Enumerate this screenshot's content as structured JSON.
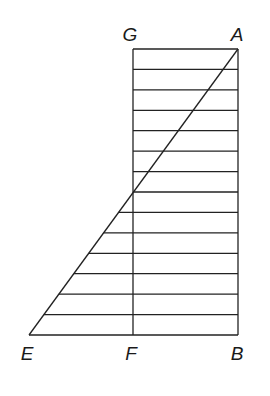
{
  "figure": {
    "type": "geometric-diagram",
    "stroke_color": "#222222",
    "background": "#ffffff",
    "points": {
      "G": {
        "label": "G",
        "x": 133,
        "y": 49
      },
      "A": {
        "label": "A",
        "x": 238,
        "y": 49
      },
      "E": {
        "label": "E",
        "x": 29,
        "y": 335
      },
      "F": {
        "label": "F",
        "x": 133,
        "y": 335
      },
      "B": {
        "label": "B",
        "x": 238,
        "y": 335
      }
    },
    "label_positions": {
      "G": {
        "x": 130,
        "y": 34
      },
      "A": {
        "x": 237,
        "y": 34
      },
      "E": {
        "x": 27,
        "y": 353
      },
      "F": {
        "x": 131,
        "y": 353
      },
      "B": {
        "x": 237,
        "y": 353
      }
    },
    "rectangle": {
      "corners": [
        "G",
        "A",
        "B",
        "F"
      ]
    },
    "diagonal": {
      "from": "A",
      "to": "E"
    },
    "horizontal_band_count": 14
  }
}
